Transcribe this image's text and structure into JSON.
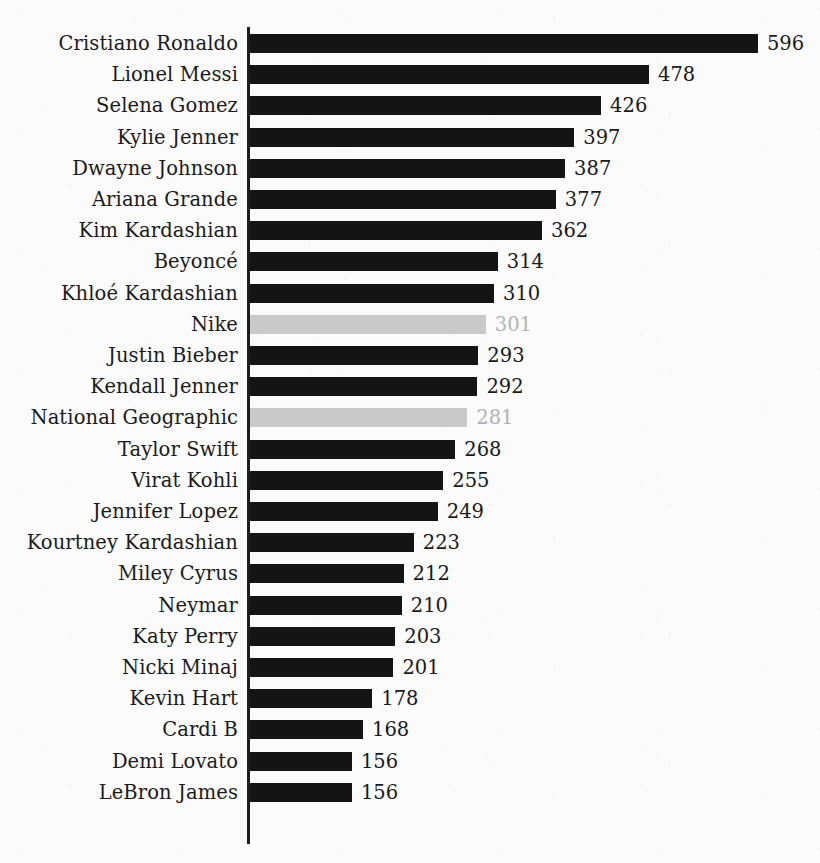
{
  "chart_data": {
    "type": "bar",
    "orientation": "horizontal",
    "title": "",
    "subtitle": "",
    "xlabel": "",
    "ylabel": "",
    "grid": false,
    "legend": false,
    "axis": {
      "value_axis_visible_ticks": [],
      "category_axis_line": true
    },
    "categories": [
      "Cristiano Ronaldo",
      "Lionel Messi",
      "Selena Gomez",
      "Kylie Jenner",
      "Dwayne Johnson",
      "Ariana Grande",
      "Kim Kardashian",
      "Beyoncé",
      "Khloé Kardashian",
      "Nike",
      "Justin Bieber",
      "Kendall Jenner",
      "National Geographic",
      "Taylor Swift",
      "Virat Kohli",
      "Jennifer Lopez",
      "Kourtney Kardashian",
      "Miley Cyrus",
      "Neymar",
      "Katy Perry",
      "Nicki Minaj",
      "Kevin Hart",
      "Cardi B",
      "Demi Lovato",
      "LeBron James"
    ],
    "values": [
      596,
      478,
      426,
      397,
      387,
      377,
      362,
      314,
      310,
      301,
      293,
      292,
      281,
      268,
      255,
      249,
      223,
      212,
      210,
      203,
      201,
      178,
      168,
      156,
      156
    ],
    "value_labels": [
      "596",
      "478",
      "426",
      "397",
      "387",
      "377",
      "362",
      "314",
      "310",
      "301",
      "293",
      "292",
      "281",
      "268",
      "255",
      "249",
      "223",
      "212",
      "210",
      "203",
      "201",
      "178",
      "168",
      "156",
      "156"
    ],
    "highlight_style": {
      "normal_bar_color": "#141414",
      "normal_label_color": "#1a1a1a",
      "muted_bar_color": "#c9c9c9",
      "muted_label_color": "#b3b3b3"
    },
    "muted_categories": [
      "Nike",
      "National Geographic"
    ],
    "bars": [
      {
        "category": "Cristiano Ronaldo",
        "value": 596,
        "label": "596",
        "muted": false
      },
      {
        "category": "Lionel Messi",
        "value": 478,
        "label": "478",
        "muted": false
      },
      {
        "category": "Selena Gomez",
        "value": 426,
        "label": "426",
        "muted": false
      },
      {
        "category": "Kylie Jenner",
        "value": 397,
        "label": "397",
        "muted": false
      },
      {
        "category": "Dwayne Johnson",
        "value": 387,
        "label": "387",
        "muted": false
      },
      {
        "category": "Ariana Grande",
        "value": 377,
        "label": "377",
        "muted": false
      },
      {
        "category": "Kim Kardashian",
        "value": 362,
        "label": "362",
        "muted": false
      },
      {
        "category": "Beyoncé",
        "value": 314,
        "label": "314",
        "muted": false
      },
      {
        "category": "Khloé Kardashian",
        "value": 310,
        "label": "310",
        "muted": false
      },
      {
        "category": "Nike",
        "value": 301,
        "label": "301",
        "muted": true
      },
      {
        "category": "Justin Bieber",
        "value": 293,
        "label": "293",
        "muted": false
      },
      {
        "category": "Kendall Jenner",
        "value": 292,
        "label": "292",
        "muted": false
      },
      {
        "category": "National Geographic",
        "value": 281,
        "label": "281",
        "muted": true
      },
      {
        "category": "Taylor Swift",
        "value": 268,
        "label": "268",
        "muted": false
      },
      {
        "category": "Virat Kohli",
        "value": 255,
        "label": "255",
        "muted": false
      },
      {
        "category": "Jennifer Lopez",
        "value": 249,
        "label": "249",
        "muted": false
      },
      {
        "category": "Kourtney Kardashian",
        "value": 223,
        "label": "223",
        "muted": false
      },
      {
        "category": "Miley Cyrus",
        "value": 212,
        "label": "212",
        "muted": false
      },
      {
        "category": "Neymar",
        "value": 210,
        "label": "210",
        "muted": false
      },
      {
        "category": "Katy Perry",
        "value": 203,
        "label": "203",
        "muted": false
      },
      {
        "category": "Nicki Minaj",
        "value": 201,
        "label": "201",
        "muted": false
      },
      {
        "category": "Kevin Hart",
        "value": 178,
        "label": "178",
        "muted": false
      },
      {
        "category": "Cardi B",
        "value": 168,
        "label": "168",
        "muted": false
      },
      {
        "category": "Demi Lovato",
        "value": 156,
        "label": "156",
        "muted": false
      },
      {
        "category": "LeBron James",
        "value": 156,
        "label": "156",
        "muted": false
      }
    ],
    "xlim": [
      156,
      596
    ]
  },
  "geometry": {
    "axis_x": 247,
    "bar_origin_x": 250,
    "first_row_top": 28,
    "row_pitch": 31.2,
    "bar_height": 19,
    "px_per_unit": 0.9227,
    "pixel_intercept": 208,
    "label_gap": 9
  }
}
